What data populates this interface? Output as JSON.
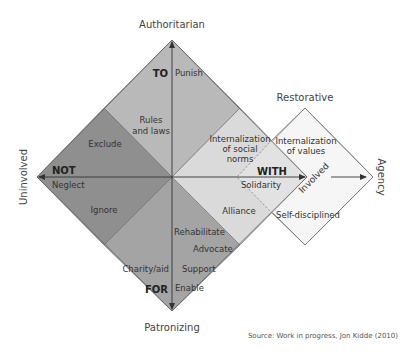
{
  "colors": {
    "not_region": "#8f8f8f",
    "to_region": "#b9b9b9",
    "for_region": "#a3a3a3",
    "with_region": "#d9d9d9",
    "restorative_region": "#f5f5f5",
    "line": "#555555",
    "text": "#333333"
  },
  "axes": {
    "top": "Authoritarian",
    "bottom": "Patronizing",
    "left": "Uninvolved",
    "right": "Agency",
    "restorative": "Restorative",
    "involved": "Involved"
  },
  "regions": {
    "to": {
      "title": "TO",
      "items": [
        "Punish",
        "Rules and laws"
      ]
    },
    "not": {
      "title": "NOT",
      "items": [
        "Exclude",
        "Neglect",
        "Ignore"
      ]
    },
    "for": {
      "title": "FOR",
      "items": [
        "Rehabilitate",
        "Advocate",
        "Charity/aid",
        "Support",
        "Enable"
      ]
    },
    "with": {
      "title": "WITH",
      "items": [
        "Internalization of social norms",
        "Solidarity",
        "Alliance"
      ]
    },
    "restorative": {
      "items": [
        "Internalization of values",
        "Self-disciplined"
      ]
    }
  },
  "labels": {
    "punish": "Punish",
    "rules_1": "Rules",
    "rules_2": "and laws",
    "exclude": "Exclude",
    "neglect": "Neglect",
    "ignore": "Ignore",
    "rehabilitate": "Rehabilitate",
    "advocate": "Advocate",
    "charity": "Charity/aid",
    "support": "Support",
    "enable": "Enable",
    "ins_1": "Internalization",
    "ins_2": "of social",
    "ins_3": "norms",
    "solidarity": "Solidarity",
    "alliance": "Alliance",
    "iv_1": "Internalization",
    "iv_2": "of values",
    "self_disciplined": "Self-disciplined"
  },
  "source": "Source: Work in progress, Jon Kidde (2010)"
}
